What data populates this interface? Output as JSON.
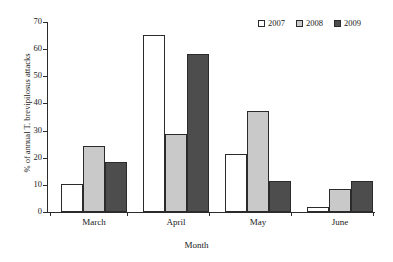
{
  "chart_data": {
    "type": "bar",
    "title": "",
    "xlabel": "Month",
    "ylabel": "% of annual T. brevipilosus attacks",
    "categories": [
      "March",
      "April",
      "May",
      "June"
    ],
    "ylim": [
      0,
      70
    ],
    "yticks": [
      0,
      10,
      20,
      30,
      40,
      50,
      60,
      70
    ],
    "grid": false,
    "legend_position": "top-right",
    "series": [
      {
        "name": "2007",
        "color": "#ffffff",
        "values": [
          10.3,
          65.2,
          21.4,
          2.0
        ]
      },
      {
        "name": "2008",
        "color": "#c9c9c9",
        "values": [
          24.4,
          28.7,
          37.4,
          8.5
        ]
      },
      {
        "name": "2009",
        "color": "#4d4d4d",
        "values": [
          18.3,
          58.4,
          11.3,
          11.3
        ]
      }
    ]
  },
  "axis": {
    "tick_labels": [
      "0",
      "10",
      "20",
      "30",
      "40",
      "50",
      "60",
      "70"
    ]
  },
  "legend": {
    "entries": [
      {
        "label": "2007"
      },
      {
        "label": "2008"
      },
      {
        "label": "2009"
      }
    ]
  }
}
